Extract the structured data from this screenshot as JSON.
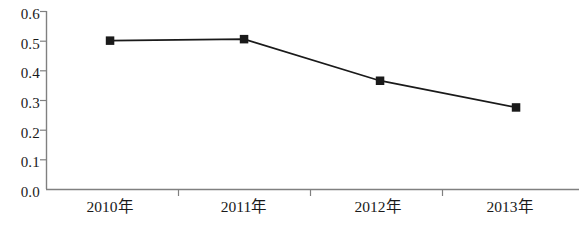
{
  "chart_data": {
    "type": "line",
    "title": "",
    "subtitle": "",
    "xlabel": "",
    "ylabel": "",
    "categories": [
      "2010年",
      "2011年",
      "2012年",
      "2013年"
    ],
    "values": [
      0.5,
      0.505,
      0.365,
      0.275
    ],
    "series": [
      {
        "name": "",
        "values": [
          0.5,
          0.505,
          0.365,
          0.275
        ]
      }
    ],
    "ylim": [
      0.0,
      0.6
    ],
    "ytick_labels": [
      "0.6",
      "0.5",
      "0.4",
      "0.3",
      "0.2",
      "0.1",
      "0.0"
    ],
    "ytick_values": [
      0.6,
      0.5,
      0.4,
      0.3,
      0.2,
      0.1,
      0.0
    ],
    "grid": false,
    "legend": null,
    "legend_position": "none",
    "marker": "square",
    "marker_color": "#1a1a1a",
    "line_color": "#1a1a1a",
    "axis_color": "#808080",
    "annotations": []
  },
  "axes": {
    "y_axis_name": "value-axis",
    "x_axis_name": "category-axis"
  }
}
